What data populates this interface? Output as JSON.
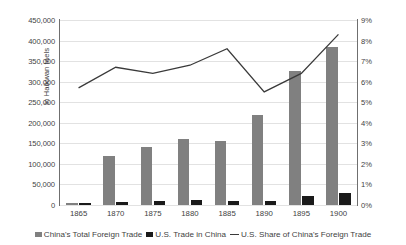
{
  "chart_data": {
    "type": "bar",
    "title": "",
    "subtitle": "",
    "xlabel": "",
    "ylabel": "In Haikwan taels",
    "y2label": "",
    "categories": [
      "1865",
      "1870",
      "1875",
      "1880",
      "1885",
      "1890",
      "1895",
      "1900"
    ],
    "ylim": [
      0,
      450000
    ],
    "y2lim": [
      0,
      0.09
    ],
    "yticks": [
      "0",
      "50,000",
      "100,000",
      "150,000",
      "200,000",
      "250,000",
      "300,000",
      "350,000",
      "400,000",
      "450,000"
    ],
    "ytick_values": [
      0,
      50000,
      100000,
      150000,
      200000,
      250000,
      300000,
      350000,
      400000,
      450000
    ],
    "y2ticks": [
      "0%",
      "1%",
      "2%",
      "3%",
      "4%",
      "5%",
      "6%",
      "7%",
      "8%",
      "9%"
    ],
    "y2tick_values": [
      0,
      1,
      2,
      3,
      4,
      5,
      6,
      7,
      8,
      9
    ],
    "grid": true,
    "legend_position": "bottom",
    "series": [
      {
        "name": "China's Total Foreign Trade",
        "type": "bar",
        "axis": "left",
        "color": "#808080",
        "values": [
          6000,
          120000,
          140000,
          160000,
          155000,
          218000,
          325000,
          385000
        ]
      },
      {
        "name": "U.S. Trade in China",
        "type": "bar",
        "axis": "left",
        "color": "#1a1a1a",
        "values": [
          4000,
          8000,
          9000,
          11000,
          9000,
          9000,
          21000,
          30000
        ]
      },
      {
        "name": "U.S. Share of China's Foreign Trade",
        "type": "line",
        "axis": "right",
        "color": "#3a3a3a",
        "values": [
          5.7,
          6.7,
          6.4,
          6.8,
          7.6,
          5.5,
          6.4,
          8.3
        ]
      }
    ]
  },
  "legend": {
    "items": [
      {
        "label": "China's Total Foreign Trade",
        "marker": "bar-gray-swatch"
      },
      {
        "label": "U.S. Trade in China",
        "marker": "bar-black-swatch"
      },
      {
        "label": "U.S. Share of China's Foreign Trade",
        "marker": "line-swatch"
      }
    ]
  },
  "colors": {
    "total_trade_bar": "#808080",
    "us_trade_bar": "#1a1a1a",
    "share_line": "#3a3a3a",
    "gridline": "#e2e2e2",
    "axis": "#6f6f6f",
    "text": "#3f3f3f",
    "background": "#ffffff"
  }
}
